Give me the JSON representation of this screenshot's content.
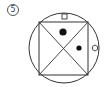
{
  "question": {
    "number_label": "5"
  },
  "figure": {
    "stroke_color": "#333333",
    "fill_color": "#111111",
    "outer_circle": {
      "cx": 64,
      "cy": 48,
      "r": 35
    },
    "inscribed_square": {
      "x": 39,
      "y": 22,
      "width": 49,
      "height": 53
    },
    "diagonals": true,
    "marks": [
      {
        "shape": "small-square",
        "position": "top-edge",
        "x": 62,
        "y": 14,
        "size": 5
      },
      {
        "shape": "large-dot",
        "region": "top-triangle",
        "cx": 63,
        "cy": 32,
        "r": 3.6
      },
      {
        "shape": "small-dot",
        "region": "right-triangle",
        "cx": 79,
        "cy": 48,
        "r": 2.6
      },
      {
        "shape": "small-hexagon",
        "position": "right-edge",
        "cx": 95,
        "cy": 48,
        "r": 3
      }
    ]
  }
}
